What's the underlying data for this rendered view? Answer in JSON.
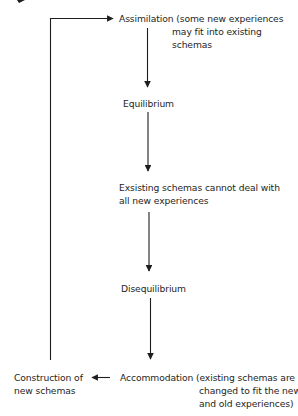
{
  "diagram": {
    "type": "flowchart",
    "colors": {
      "line": "#1e1e1e",
      "text": "#1e1e1e",
      "background": "#ffffff"
    },
    "nodes": {
      "assimilation": {
        "term": "Assimilation",
        "note_lines": [
          "(some new experiences",
          "may fit into existing",
          "schemas"
        ]
      },
      "equilibrium": {
        "label": "Equilibrium"
      },
      "existing_schemas": {
        "lines": [
          "Exsisting schemas cannot deal with",
          "all new experiences"
        ]
      },
      "disequilibrium": {
        "label": "Disequilibrium"
      },
      "accommodation": {
        "term": "Accommodation",
        "note_lines": [
          "(existing schemas are",
          "changed to fit the new",
          "and old experiences)"
        ]
      },
      "construction": {
        "lines": [
          "Construction of",
          "new schemas"
        ]
      }
    },
    "edges": [
      {
        "from": "assimilation",
        "to": "equilibrium"
      },
      {
        "from": "equilibrium",
        "to": "existing_schemas"
      },
      {
        "from": "existing_schemas",
        "to": "disequilibrium"
      },
      {
        "from": "disequilibrium",
        "to": "accommodation"
      },
      {
        "from": "accommodation",
        "to": "construction"
      },
      {
        "from": "construction",
        "to": "assimilation"
      }
    ]
  }
}
